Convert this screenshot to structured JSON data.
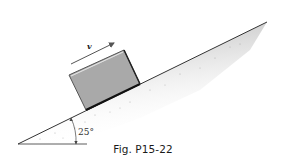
{
  "figure": {
    "caption": "Fig. P15-22",
    "velocity_label": "v",
    "angle_label": "25°",
    "incline_angle_deg": 25,
    "colors": {
      "block_fill": "#a9a9a9",
      "block_edge": "#1a1a1a",
      "ground_shade": "#c8c8c8",
      "arrow": "#555555",
      "line": "#333333"
    }
  }
}
